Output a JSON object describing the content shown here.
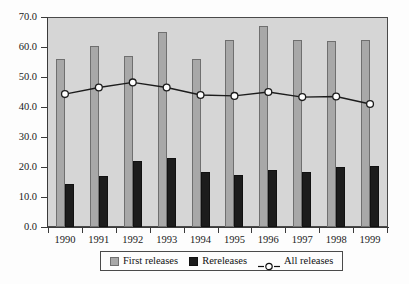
{
  "chart_data": {
    "type": "bar",
    "title": "",
    "subtitle": "",
    "xlabel": "",
    "ylabel": "",
    "categories": [
      "1990",
      "1991",
      "1992",
      "1993",
      "1994",
      "1995",
      "1996",
      "1997",
      "1998",
      "1999"
    ],
    "series": [
      {
        "name": "First releases",
        "type": "bar",
        "color": "#a8a8a8",
        "values": [
          56.0,
          60.5,
          57.0,
          65.0,
          56.0,
          62.5,
          67.0,
          62.5,
          62.0,
          62.5
        ]
      },
      {
        "name": "Rereleases",
        "type": "bar",
        "color": "#1c1c1c",
        "values": [
          14.5,
          17.0,
          22.0,
          23.0,
          18.5,
          17.5,
          19.0,
          18.5,
          20.0,
          20.5
        ]
      },
      {
        "name": "All releases",
        "type": "line",
        "color": "#1c1c1c",
        "marker": "open-circle",
        "values": [
          44.3,
          46.5,
          48.2,
          46.5,
          44.0,
          43.7,
          45.0,
          43.3,
          43.5,
          41.0
        ]
      }
    ],
    "ylim": [
      0.0,
      70.0
    ],
    "ytick_step": 10.0,
    "ytick_labels": [
      "70.0",
      "60.0",
      "50.0",
      "40.0",
      "30.0",
      "20.0",
      "10.0",
      "0.0"
    ],
    "grid": false,
    "legend_position": "bottom-center",
    "plot_background": "#d6d6d6",
    "figure_background": "#fdfdfd"
  },
  "legend": {
    "entries": [
      {
        "label": "First releases",
        "swatch": "gray-square-swatch"
      },
      {
        "label": "Rereleases",
        "swatch": "black-square-swatch"
      },
      {
        "label": "All releases",
        "swatch": "line-circle-marker"
      }
    ]
  }
}
